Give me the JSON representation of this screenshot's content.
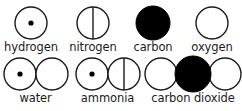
{
  "diagram": {
    "background_color": "#ffffff",
    "stroke_color": "#1b1b1b",
    "fill_color": "#000000"
  },
  "atom_key": {
    "row_label": "atom key",
    "atoms": [
      {
        "name": "hydrogen",
        "label": "hydrogen",
        "symbol": "circle-with-center-dot",
        "fill": "#ffffff",
        "stroke": "#1b1b1b",
        "radius": 16
      },
      {
        "name": "nitrogen",
        "label": "nitrogen",
        "symbol": "circle-with-vertical-line",
        "fill": "#ffffff",
        "stroke": "#1b1b1b",
        "radius": 16
      },
      {
        "name": "carbon",
        "label": "carbon",
        "symbol": "filled-circle",
        "fill": "#000000",
        "stroke": "#000000",
        "radius": 17
      },
      {
        "name": "oxygen",
        "label": "oxygen",
        "symbol": "empty-circle",
        "fill": "#ffffff",
        "stroke": "#1b1b1b",
        "radius": 16
      }
    ]
  },
  "molecules": {
    "row_label": "molecules",
    "items": [
      {
        "name": "water",
        "label": "water",
        "formula_atoms": [
          "hydrogen",
          "oxygen"
        ],
        "atom_count": 2
      },
      {
        "name": "ammonia",
        "label": "ammonia",
        "formula_atoms": [
          "hydrogen",
          "nitrogen"
        ],
        "atom_count": 2
      },
      {
        "name": "carbon dioxide",
        "label": "carbon dioxide",
        "formula_atoms": [
          "oxygen",
          "carbon",
          "oxygen"
        ],
        "atom_count": 3
      }
    ]
  }
}
